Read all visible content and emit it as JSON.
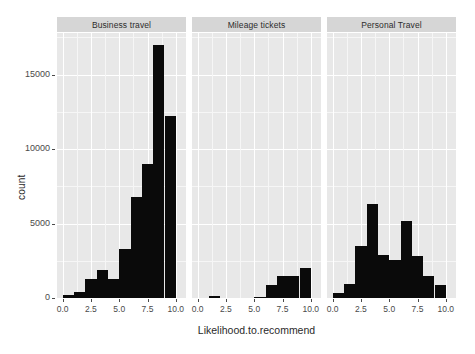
{
  "chart_data": {
    "type": "bar",
    "title": "",
    "subtitle": "",
    "xlabel": "Likelihood.to.recommend",
    "ylabel": "count",
    "xlim": [
      -0.5,
      10.9
    ],
    "ylim": [
      0,
      17800
    ],
    "grid": true,
    "legend": null,
    "facet_labels": [
      "Business travel",
      "Mileage tickets",
      "Personal Travel"
    ],
    "x_ticks": [
      "0.0",
      "2.5",
      "5.0",
      "7.5",
      "10.0"
    ],
    "x_tick_values": [
      0.0,
      2.5,
      5.0,
      7.5,
      10.0
    ],
    "y_ticks": [
      "0",
      "5000",
      "10000",
      "15000"
    ],
    "y_tick_values": [
      0,
      5000,
      10000,
      15000
    ],
    "panels": [
      {
        "label": "Business travel",
        "bin_centers": [
          0.5,
          1.5,
          2.5,
          3.5,
          4.5,
          5.5,
          6.5,
          7.5,
          8.5,
          9.5
        ],
        "values": [
          180,
          430,
          1300,
          1900,
          1250,
          3300,
          6800,
          9000,
          17000,
          12200
        ]
      },
      {
        "label": "Mileage tickets",
        "bin_centers": [
          0.5,
          1.5,
          2.5,
          3.5,
          4.5,
          5.5,
          6.5,
          7.5,
          8.5,
          9.5
        ],
        "values": [
          0,
          150,
          0,
          0,
          0,
          60,
          900,
          1450,
          1500,
          2000,
          950
        ]
      },
      {
        "label": "Personal Travel",
        "bin_centers": [
          0.5,
          1.5,
          2.5,
          3.5,
          4.5,
          5.5,
          6.5,
          7.5,
          8.5,
          9.5
        ],
        "values": [
          330,
          950,
          3500,
          6300,
          2900,
          2550,
          5200,
          2850,
          1450,
          850
        ]
      }
    ]
  },
  "colors": {
    "panel_background": "#e8e8e8",
    "strip_background": "#d6d6d6",
    "bar_fill": "#0a0a0a",
    "gridline_major": "#ffffff",
    "page_background": "#ffffff",
    "text": "#2a2a2a"
  }
}
